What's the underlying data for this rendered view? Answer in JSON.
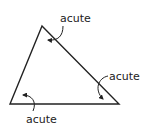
{
  "diagram": {
    "type": "triangle",
    "classification": "acute triangle",
    "stroke_color": "#222222",
    "vertices": {
      "top": [
        42,
        26
      ],
      "bottom_left": [
        10,
        104
      ],
      "bottom_right": [
        119,
        104
      ]
    },
    "labels": [
      {
        "id": "top",
        "text": "acute"
      },
      {
        "id": "right",
        "text": "acute"
      },
      {
        "id": "bottom_left",
        "text": "acute"
      }
    ]
  }
}
